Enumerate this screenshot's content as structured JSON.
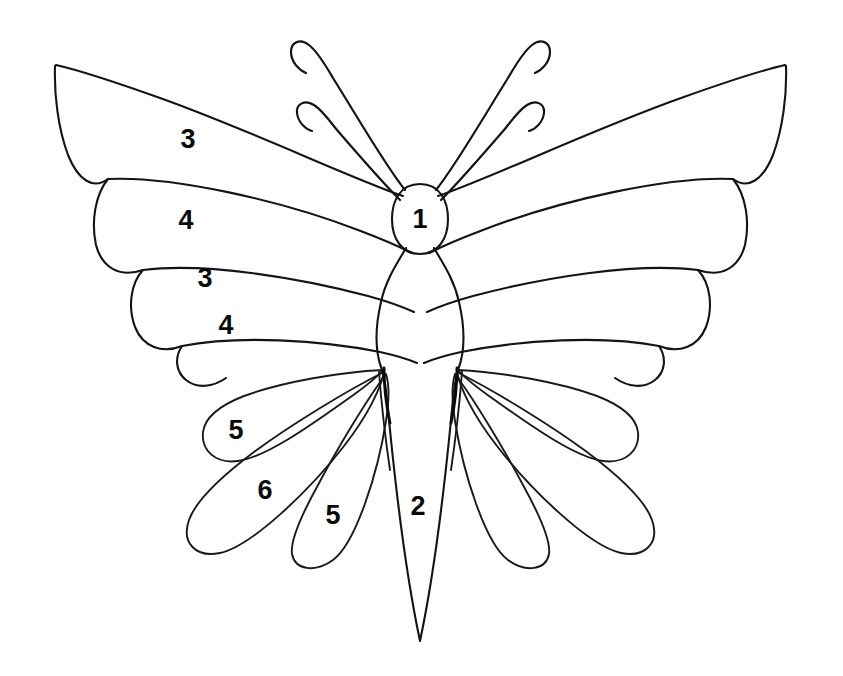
{
  "figure": {
    "background_color": "#ffffff",
    "line_color": "#141414",
    "label_color": "#0a0a0a",
    "width": 843,
    "height": 676
  },
  "labels": [
    {
      "id": "label-1",
      "text": "1",
      "part": "head",
      "x": 420,
      "y": 221
    },
    {
      "id": "label-2",
      "text": "2",
      "part": "abdomen",
      "x": 418,
      "y": 508
    },
    {
      "id": "label-3a",
      "text": "3",
      "part": "forewing-upper-left",
      "x": 188,
      "y": 141
    },
    {
      "id": "label-4a",
      "text": "4",
      "part": "forewing-second-left",
      "x": 186,
      "y": 222
    },
    {
      "id": "label-3b",
      "text": "3",
      "part": "forewing-third-left",
      "x": 205,
      "y": 280
    },
    {
      "id": "label-4b",
      "text": "4",
      "part": "forewing-fourth-left",
      "x": 226,
      "y": 327
    },
    {
      "id": "label-5a",
      "text": "5",
      "part": "hindwing-upper-left",
      "x": 236,
      "y": 432
    },
    {
      "id": "label-6",
      "text": "6",
      "part": "hindwing-middle-left",
      "x": 265,
      "y": 492
    },
    {
      "id": "label-5b",
      "text": "5",
      "part": "hindwing-lower-left",
      "x": 333,
      "y": 517
    }
  ],
  "parts": [
    {
      "number": "1",
      "name": "head"
    },
    {
      "number": "2",
      "name": "abdomen"
    },
    {
      "number": "3",
      "name": "forewing-outer-segment"
    },
    {
      "number": "4",
      "name": "forewing-inner-segment"
    },
    {
      "number": "5",
      "name": "hindwing-outer-segment"
    },
    {
      "number": "6",
      "name": "hindwing-inner-segment"
    }
  ],
  "anatomy": {
    "antennae_count": 4,
    "forewing_segments_per_side": 4,
    "hindwing_segments_per_side": 3
  }
}
